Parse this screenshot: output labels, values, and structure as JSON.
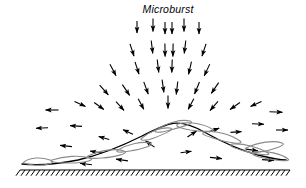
{
  "figure": {
    "title": "Microburst",
    "title_x": 168,
    "title_y": 13,
    "width": 306,
    "height": 188,
    "background_color": "#ffffff",
    "line_color": "#000000",
    "outflow_curve_color": "#6e6e6e"
  },
  "ground": {
    "line_y": 170,
    "x_start": 20,
    "x_end": 290,
    "hatch_count": 54,
    "hatch_length": 7,
    "hatch_angle_deg": 35,
    "color": "#000000"
  },
  "downdraft": {
    "core_x": 168,
    "top_y": 22,
    "label": "Microburst",
    "arrows": [
      {
        "x": 137,
        "y": 27,
        "angle": 90,
        "len": 12
      },
      {
        "x": 153,
        "y": 25,
        "angle": 90,
        "len": 13
      },
      {
        "x": 165,
        "y": 28,
        "angle": 90,
        "len": 12
      },
      {
        "x": 172,
        "y": 28,
        "angle": 90,
        "len": 12
      },
      {
        "x": 184,
        "y": 25,
        "angle": 90,
        "len": 13
      },
      {
        "x": 199,
        "y": 28,
        "angle": 90,
        "len": 12
      },
      {
        "x": 132,
        "y": 50,
        "angle": 72,
        "len": 13
      },
      {
        "x": 152,
        "y": 47,
        "angle": 83,
        "len": 13
      },
      {
        "x": 165,
        "y": 50,
        "angle": 89,
        "len": 13
      },
      {
        "x": 173,
        "y": 50,
        "angle": 91,
        "len": 13
      },
      {
        "x": 185,
        "y": 47,
        "angle": 97,
        "len": 13
      },
      {
        "x": 204,
        "y": 50,
        "angle": 108,
        "len": 13
      },
      {
        "x": 113,
        "y": 70,
        "angle": 62,
        "len": 13
      },
      {
        "x": 137,
        "y": 68,
        "angle": 72,
        "len": 13
      },
      {
        "x": 158,
        "y": 66,
        "angle": 83,
        "len": 13
      },
      {
        "x": 172,
        "y": 66,
        "angle": 92,
        "len": 13
      },
      {
        "x": 190,
        "y": 68,
        "angle": 103,
        "len": 13
      },
      {
        "x": 207,
        "y": 70,
        "angle": 115,
        "len": 13
      },
      {
        "x": 104,
        "y": 90,
        "angle": 48,
        "len": 13
      },
      {
        "x": 126,
        "y": 90,
        "angle": 56,
        "len": 13
      },
      {
        "x": 146,
        "y": 88,
        "angle": 70,
        "len": 13
      },
      {
        "x": 163,
        "y": 86,
        "angle": 82,
        "len": 13
      },
      {
        "x": 177,
        "y": 88,
        "angle": 97,
        "len": 13
      },
      {
        "x": 197,
        "y": 88,
        "angle": 112,
        "len": 13
      },
      {
        "x": 215,
        "y": 88,
        "angle": 124,
        "len": 13
      },
      {
        "x": 80,
        "y": 104,
        "angle": 24,
        "len": 12
      },
      {
        "x": 99,
        "y": 106,
        "angle": 36,
        "len": 12
      },
      {
        "x": 120,
        "y": 106,
        "angle": 48,
        "len": 12
      },
      {
        "x": 141,
        "y": 104,
        "angle": 62,
        "len": 12
      },
      {
        "x": 168,
        "y": 102,
        "angle": 90,
        "len": 13
      },
      {
        "x": 191,
        "y": 104,
        "angle": 118,
        "len": 12
      },
      {
        "x": 214,
        "y": 106,
        "angle": 131,
        "len": 12
      },
      {
        "x": 235,
        "y": 106,
        "angle": 145,
        "len": 12
      },
      {
        "x": 256,
        "y": 104,
        "angle": 156,
        "len": 12
      }
    ]
  },
  "outflow": {
    "arrows_left": [
      {
        "x": 52,
        "y": 110,
        "angle": 180,
        "len": 13
      },
      {
        "x": 42,
        "y": 128,
        "angle": 178,
        "len": 12
      },
      {
        "x": 76,
        "y": 126,
        "angle": 184,
        "len": 12
      },
      {
        "x": 66,
        "y": 146,
        "angle": 186,
        "len": 12
      },
      {
        "x": 96,
        "y": 152,
        "angle": 190,
        "len": 12
      },
      {
        "x": 104,
        "y": 138,
        "angle": 195,
        "len": 11
      },
      {
        "x": 128,
        "y": 132,
        "angle": 205,
        "len": 11
      },
      {
        "x": 150,
        "y": 144,
        "angle": 215,
        "len": 11
      },
      {
        "x": 86,
        "y": 164,
        "angle": 187,
        "len": 12
      },
      {
        "x": 122,
        "y": 160,
        "angle": 188,
        "len": 12
      }
    ],
    "arrows_right": [
      {
        "x": 276,
        "y": 112,
        "angle": 2,
        "len": 13
      },
      {
        "x": 258,
        "y": 124,
        "angle": 2,
        "len": 12
      },
      {
        "x": 282,
        "y": 130,
        "angle": 0,
        "len": 12
      },
      {
        "x": 236,
        "y": 132,
        "angle": 356,
        "len": 11
      },
      {
        "x": 214,
        "y": 130,
        "angle": 340,
        "len": 11
      },
      {
        "x": 192,
        "y": 134,
        "angle": 326,
        "len": 11
      },
      {
        "x": 252,
        "y": 150,
        "angle": 8,
        "len": 12
      },
      {
        "x": 216,
        "y": 158,
        "angle": 6,
        "len": 12
      },
      {
        "x": 268,
        "y": 160,
        "angle": 4,
        "len": 12
      },
      {
        "x": 186,
        "y": 152,
        "angle": 352,
        "len": 11
      }
    ]
  },
  "curve": {
    "points_description": "Outflow boundary / roll vortex curve rising from the lower left, peaking near x=170 y=124, descending to the lower right",
    "peak_x": 170,
    "peak_y": 124,
    "left_end_x": 22,
    "left_end_y": 164,
    "right_end_x": 286,
    "right_end_y": 160
  }
}
